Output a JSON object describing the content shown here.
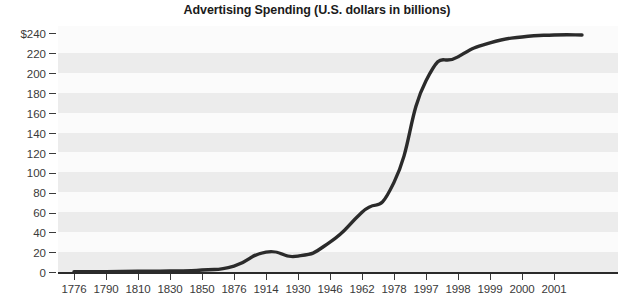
{
  "chart_data": {
    "type": "line",
    "title": "Advertising Spending (U.S. dollars in billions)",
    "xlabel": "",
    "ylabel": "",
    "categories": [
      "1776",
      "1790",
      "1810",
      "1830",
      "1850",
      "1876",
      "1914",
      "1930",
      "1946",
      "1962",
      "1978",
      "1997",
      "1998",
      "1999",
      "2000",
      "2001"
    ],
    "values": [
      0.2,
      0.4,
      0.7,
      1,
      2,
      6,
      20,
      16,
      30,
      60,
      90,
      192,
      216,
      230,
      236,
      238
    ],
    "series": [
      {
        "name": "Advertising Spending",
        "values": [
          0.2,
          0.4,
          0.7,
          1,
          2,
          6,
          20,
          16,
          30,
          60,
          90,
          192,
          216,
          230,
          236,
          238
        ],
        "color": "#2b2b2b"
      }
    ],
    "yticks": [
      0,
      20,
      40,
      60,
      80,
      100,
      120,
      140,
      160,
      180,
      200,
      220,
      240
    ],
    "ytick_labels": [
      "0",
      "20",
      "40",
      "60",
      "80",
      "100",
      "120",
      "140",
      "160",
      "180",
      "200",
      "220",
      "$240"
    ],
    "ylim": [
      0,
      240
    ],
    "grid": false,
    "banded_background": true,
    "legend": "none",
    "line_color": "#2b2b2b",
    "band_color": "#ececec",
    "plot_background": "#fbfbfb"
  }
}
